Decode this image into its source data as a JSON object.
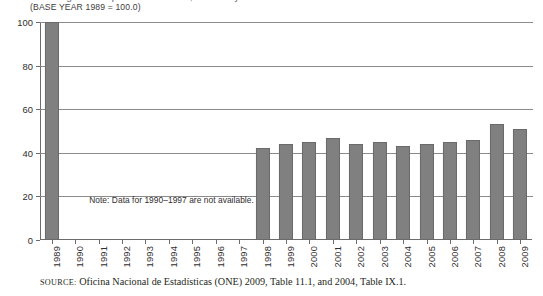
{
  "figure": {
    "title_partial": "Cuban agricultural production indices, selected years",
    "subtitle": "(BASE YEAR 1989 = 100.0)",
    "note": "Note: Data for 1990–1997 are not available.",
    "source_prefix": "SOURCE:",
    "source_text": "Oficina Nacional de Estadísticas (ONE) 2009, Table 11.1, and 2004, Table IX.1."
  },
  "chart_data": {
    "type": "bar",
    "title": "",
    "subtitle": "(BASE YEAR 1989 = 100.0)",
    "xlabel": "",
    "ylabel": "",
    "ylim": [
      0,
      100
    ],
    "yticks": [
      0,
      20,
      40,
      60,
      80,
      100
    ],
    "grid": true,
    "legend": "none",
    "bar_color": "#808080",
    "categories": [
      "1989",
      "1990",
      "1991",
      "1992",
      "1993",
      "1994",
      "1995",
      "1996",
      "1997",
      "1998",
      "1999",
      "2000",
      "2001",
      "2002",
      "2003",
      "2004",
      "2005",
      "2006",
      "2007",
      "2008",
      "2009"
    ],
    "values": [
      100,
      null,
      null,
      null,
      null,
      null,
      null,
      null,
      null,
      42,
      44,
      45,
      47,
      44,
      45,
      43,
      44,
      45,
      46,
      53,
      51
    ],
    "missing_categories": [
      "1990",
      "1991",
      "1992",
      "1993",
      "1994",
      "1995",
      "1996",
      "1997"
    ],
    "annotations": [
      "Note: Data for 1990–1997 are not available."
    ]
  }
}
